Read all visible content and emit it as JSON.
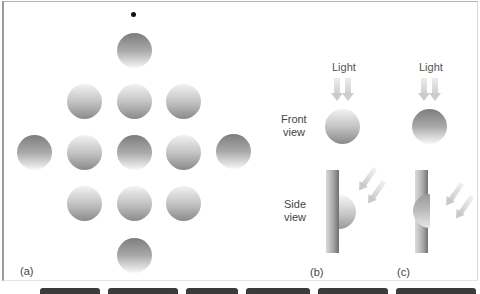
{
  "figure": {
    "panels": {
      "a": {
        "label": "(a)",
        "fixation_dot": true,
        "grid": [
          {
            "row": 0,
            "balls": [
              "dark-top"
            ]
          },
          {
            "row": 1,
            "balls": [
              "light-top",
              "light-top",
              "light-top"
            ]
          },
          {
            "row": 2,
            "balls": [
              "dark-top",
              "light-top",
              "dark-top",
              "light-top",
              "dark-top"
            ]
          },
          {
            "row": 3,
            "balls": [
              "light-top",
              "light-top",
              "light-top"
            ]
          },
          {
            "row": 4,
            "balls": [
              "dark-top"
            ]
          }
        ]
      },
      "b": {
        "label": "(b)",
        "light_label": "Light",
        "shape": "bump (convex)",
        "front_shading": "light-top"
      },
      "c": {
        "label": "(c)",
        "light_label": "Light",
        "shape": "dent (concave)",
        "front_shading": "dark-top"
      }
    },
    "row_labels": {
      "front_line1": "Front",
      "front_line2": "view",
      "side_line1": "Side",
      "side_line2": "view"
    }
  }
}
